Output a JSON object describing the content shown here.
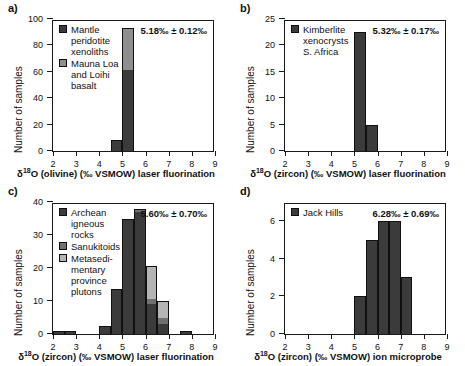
{
  "figure": {
    "panels": [
      {
        "letter": "a)",
        "stats": "5.18‰ ± 0.12‰",
        "legend": [
          {
            "label": "Mantle\nperidotite\nxenoliths",
            "color": "#3b3b3b"
          },
          {
            "label": "Mauna Loa\nand Loihi\nbasalt",
            "color": "#8e8e8e"
          }
        ],
        "chart_data": {
          "type": "bar",
          "title": "",
          "xlabel": "δ¹⁸O (olivine) (‰ VSMOW) laser fluorination",
          "ylabel": "Number of samples",
          "xlim": [
            2,
            9
          ],
          "ylim": [
            0,
            100
          ],
          "xticks": [
            2,
            3,
            4,
            5,
            6,
            7,
            8,
            9
          ],
          "yticks": [
            0,
            20,
            40,
            60,
            80,
            100
          ],
          "bin_width": 0.5,
          "grid": false,
          "legend_position": "top-left",
          "series": [
            {
              "name": "Mantle peridotite xenoliths",
              "color": "#3b3b3b",
              "bins": [
                4.5,
                5.0
              ],
              "values": [
                8,
                61
              ]
            },
            {
              "name": "Mauna Loa and Loihi basalt",
              "color": "#8e8e8e",
              "bins": [
                4.5,
                5.0
              ],
              "values": [
                0,
                32
              ]
            }
          ]
        }
      },
      {
        "letter": "b)",
        "stats": "5.32‰ ± 0.17‰",
        "legend": [
          {
            "label": "Kimberlite\nxenocrysts\nS. Africa",
            "color": "#3b3b3b"
          }
        ],
        "chart_data": {
          "type": "bar",
          "title": "",
          "xlabel": "δ¹⁸O (zircon) (‰ VSMOW) laser fluorination",
          "ylabel": "Number of samples",
          "xlim": [
            2,
            9
          ],
          "ylim": [
            0,
            25
          ],
          "xticks": [
            2,
            3,
            4,
            5,
            6,
            7,
            8,
            9
          ],
          "yticks": [
            0,
            5,
            10,
            15,
            20,
            25
          ],
          "bin_width": 0.5,
          "grid": false,
          "legend_position": "top-left",
          "series": [
            {
              "name": "Kimberlite xenocrysts S. Africa",
              "color": "#3b3b3b",
              "bins": [
                5.0,
                5.5
              ],
              "values": [
                22.5,
                5
              ]
            }
          ]
        }
      },
      {
        "letter": "c)",
        "stats": "5.60‰ ± 0.70‰",
        "legend": [
          {
            "label": "Archean\nigneous\nrocks",
            "color": "#3b3b3b"
          },
          {
            "label": "Sanukitoids",
            "color": "#707070"
          },
          {
            "label": "Metasedi-\nmentary\nprovince\nplutons",
            "color": "#b5b5b5"
          }
        ],
        "chart_data": {
          "type": "bar",
          "title": "",
          "xlabel": "δ¹⁸O (zircon) (‰ VSMOW) laser fluorination",
          "ylabel": "Number of samples",
          "xlim": [
            2,
            9
          ],
          "ylim": [
            0,
            40
          ],
          "xticks": [
            2,
            3,
            4,
            5,
            6,
            7,
            8,
            9
          ],
          "yticks": [
            0,
            10,
            20,
            30,
            40
          ],
          "bin_width": 0.5,
          "grid": false,
          "legend_position": "top-left",
          "series": [
            {
              "name": "Archean igneous rocks",
              "color": "#3b3b3b",
              "bins": [
                2.0,
                2.5,
                4.0,
                4.5,
                5.0,
                5.5,
                6.0,
                6.5,
                7.5
              ],
              "values": [
                1,
                1,
                2.5,
                13.5,
                35,
                37,
                9,
                3,
                1
              ]
            },
            {
              "name": "Sanukitoids",
              "color": "#707070",
              "bins": [
                2.0,
                2.5,
                4.0,
                4.5,
                5.0,
                5.5,
                6.0,
                6.5,
                7.5
              ],
              "values": [
                0,
                0,
                0,
                0,
                0,
                0.7,
                1.5,
                2,
                0
              ]
            },
            {
              "name": "Metasedimentary province plutons",
              "color": "#b5b5b5",
              "bins": [
                2.0,
                2.5,
                4.0,
                4.5,
                5.0,
                5.5,
                6.0,
                6.5,
                7.5
              ],
              "values": [
                0,
                0,
                0,
                0,
                0,
                0.3,
                10,
                5,
                0
              ]
            }
          ]
        }
      },
      {
        "letter": "d)",
        "stats": "6.28‰ ± 0.69‰",
        "legend": [
          {
            "label": "Jack Hills",
            "color": "#3b3b3b"
          }
        ],
        "chart_data": {
          "type": "bar",
          "title": "",
          "xlabel": "δ¹⁸O (zircon) (‰ VSMOW) ion microprobe",
          "ylabel": "Number of samples",
          "xlim": [
            2,
            9
          ],
          "ylim": [
            0,
            7
          ],
          "xticks": [
            2,
            3,
            4,
            5,
            6,
            7,
            8,
            9
          ],
          "yticks": [
            0,
            2,
            4,
            6
          ],
          "bin_width": 0.5,
          "grid": false,
          "legend_position": "top-left",
          "series": [
            {
              "name": "Jack Hills",
              "color": "#3b3b3b",
              "bins": [
                5.0,
                5.5,
                6.0,
                6.5,
                7.0
              ],
              "values": [
                2,
                5,
                6,
                6,
                3
              ]
            }
          ]
        }
      }
    ]
  }
}
